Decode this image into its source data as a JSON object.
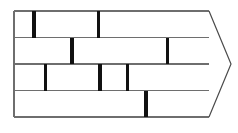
{
  "figure": {
    "name": "brick-bond-diagram",
    "title": "Brick wall running bond pattern with right-pointing chevron",
    "canvas": {
      "width": 238,
      "height": 133
    },
    "background_color": "#ffffff"
  },
  "styles": {
    "bed_joint_color": "#6e6e6e",
    "bed_joint_width": 1.2,
    "head_joint_color": "#111111",
    "head_joint_width": 3.2,
    "chevron_color": "#4a4a4a",
    "chevron_width": 1.2,
    "wall_edge_color": "#6e6e6e",
    "wall_edge_width": 1.2
  },
  "geometry": {
    "wall_left_x": 14,
    "wall_right_x": 209,
    "wall_top_y": 11,
    "wall_bottom_y": 117,
    "chevron_tip_x": 231,
    "chevron_tip_y": 64
  },
  "bed_joints": [
    {
      "label": "course-line-top",
      "y": 11
    },
    {
      "label": "course-line-1",
      "y": 37.5
    },
    {
      "label": "course-line-2",
      "y": 64
    },
    {
      "label": "course-line-3",
      "y": 90.5
    },
    {
      "label": "course-line-bottom",
      "y": 117
    }
  ],
  "courses": [
    {
      "label": "course-1",
      "top": 11,
      "bottom": 37.5,
      "head_joints": [
        {
          "label": "head-joint-1-1",
          "x": 34
        },
        {
          "label": "head-joint-1-2",
          "x": 98.5
        }
      ]
    },
    {
      "label": "course-2",
      "top": 37.5,
      "bottom": 64,
      "head_joints": [
        {
          "label": "head-joint-2-1",
          "x": 72
        },
        {
          "label": "head-joint-2-2",
          "x": 167.5
        }
      ]
    },
    {
      "label": "course-3",
      "top": 64,
      "bottom": 90.5,
      "head_joints": [
        {
          "label": "head-joint-3-1",
          "x": 45.5
        },
        {
          "label": "head-joint-3-2",
          "x": 100
        },
        {
          "label": "head-joint-3-3",
          "x": 127.5
        }
      ]
    },
    {
      "label": "course-4",
      "top": 90.5,
      "bottom": 117,
      "head_joints": [
        {
          "label": "head-joint-4-1",
          "x": 146
        }
      ]
    }
  ],
  "chevron": {
    "label": "right-chevron-arrow",
    "points": "209,11 231,64 209,117"
  },
  "wall_edges": [
    {
      "label": "wall-left-edge",
      "x1": 14,
      "y1": 11,
      "x2": 14,
      "y2": 117
    }
  ]
}
